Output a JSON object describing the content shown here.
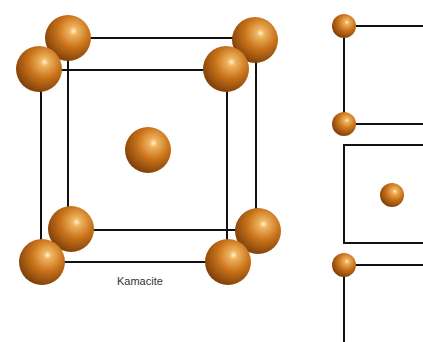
{
  "diagram": {
    "caption": "Kamacite",
    "atom_color": "#c4701a",
    "line_color": "#111111"
  }
}
